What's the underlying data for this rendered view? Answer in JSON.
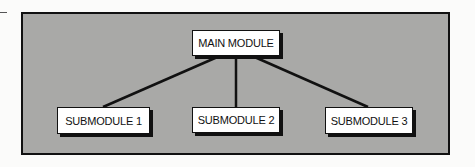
{
  "diagram": {
    "type": "hierarchy",
    "colors": {
      "frame_fill": "#a9a9a7",
      "frame_border": "#111111",
      "box_fill": "#ffffff",
      "line": "#111111"
    },
    "root": {
      "label": "MAIN MODULE"
    },
    "children": [
      {
        "label": "SUBMODULE 1"
      },
      {
        "label": "SUBMODULE 2"
      },
      {
        "label": "SUBMODULE 3"
      }
    ]
  }
}
